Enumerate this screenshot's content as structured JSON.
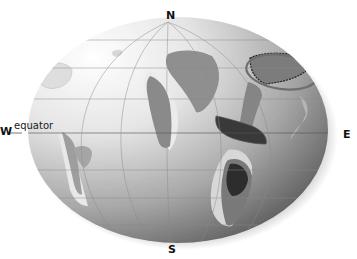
{
  "map": {
    "title": "",
    "projection": "globe (oblique orthographic, paleogeographic reconstruction)",
    "compass": {
      "north": "N",
      "south": "S",
      "west": "W",
      "east": "E"
    },
    "annotations": {
      "equator_label": "equator",
      "highlight": "ellipse outline around northeastern landmass"
    },
    "colors": {
      "globe_light": "#f2f2f2",
      "globe_dark": "#6e6e6e",
      "land_light": "#c8c8c8",
      "land_mid": "#8f8f8f",
      "land_dark": "#3a3a3a",
      "shelf": "#e4e4e4",
      "grid": "#8a8a8a",
      "highlight_ring": "#707070"
    }
  }
}
